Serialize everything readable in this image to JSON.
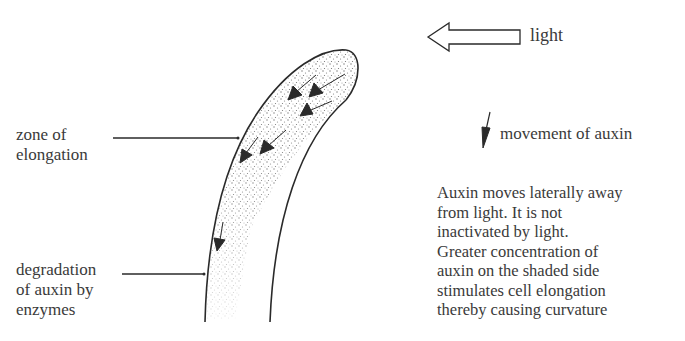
{
  "diagram": {
    "light": {
      "icon": "hollow-left-arrow-icon",
      "label": "light"
    },
    "legend": {
      "icon": "down-arrow-icon",
      "label": "movement of auxin"
    },
    "labels": {
      "zone_of_elongation": [
        "zone of",
        "elongation"
      ],
      "degradation": [
        "degradation",
        "of auxin by",
        "enzymes"
      ]
    },
    "explanation": [
      "Auxin moves laterally away",
      "from light. It is not",
      "inactivated by light.",
      "Greater concentration of",
      "auxin on the shaded side",
      "stimulates cell elongation",
      "thereby causing curvature"
    ],
    "colors": {
      "ink": "#2a2a2a",
      "text": "#3a3a3a",
      "background": "#ffffff",
      "stipple": "#6a6a6a"
    }
  }
}
